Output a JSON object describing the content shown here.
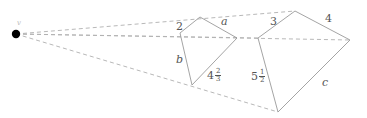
{
  "figure": {
    "type": "geometry-diagram",
    "colors": {
      "solid_stroke": "#9a9a9a",
      "dashed_stroke": "#b0b0b0",
      "center_point": "#000000",
      "label_text": "#555555",
      "background": "#ffffff"
    },
    "center_point": {
      "label": "v",
      "x": 16,
      "y": 34
    },
    "quad_left": {
      "vertices": [
        {
          "name": "top",
          "x": 200,
          "y": 17
        },
        {
          "name": "right",
          "x": 237,
          "y": 38
        },
        {
          "name": "bottom",
          "x": 192,
          "y": 85
        },
        {
          "name": "left",
          "x": 180,
          "y": 33
        }
      ]
    },
    "quad_right": {
      "vertices": [
        {
          "name": "top",
          "x": 295,
          "y": 11
        },
        {
          "name": "right",
          "x": 350,
          "y": 40
        },
        {
          "name": "bottom",
          "x": 278,
          "y": 112
        },
        {
          "name": "left",
          "x": 258,
          "y": 38
        }
      ]
    },
    "rays": [
      {
        "name": "ray-to-top-vertices",
        "from_x": 16,
        "from_y": 34,
        "to_x": 295,
        "to_y": 11
      },
      {
        "name": "ray-to-left-vertices",
        "from_x": 16,
        "from_y": 34,
        "to_x": 350,
        "to_y": 40
      },
      {
        "name": "ray-to-right-vertices",
        "from_x": 16,
        "from_y": 34,
        "to_x": 350,
        "to_y": 40
      },
      {
        "name": "ray-to-bottom-vertices",
        "from_x": 16,
        "from_y": 34,
        "to_x": 278,
        "to_y": 112
      }
    ],
    "labels": {
      "left_quad_top_side": "2",
      "left_quad_upper_right_side": "a",
      "left_quad_left_side": "b",
      "left_quad_lower_right_side_whole": "4",
      "left_quad_lower_right_side_numerator": "2",
      "left_quad_lower_right_side_denominator": "3",
      "right_quad_top_side": "3",
      "right_quad_upper_right_side": "4",
      "right_quad_left_side_whole": "5",
      "right_quad_left_side_numerator": "1",
      "right_quad_left_side_denominator": "2",
      "right_quad_lower_right_side": "c"
    }
  }
}
